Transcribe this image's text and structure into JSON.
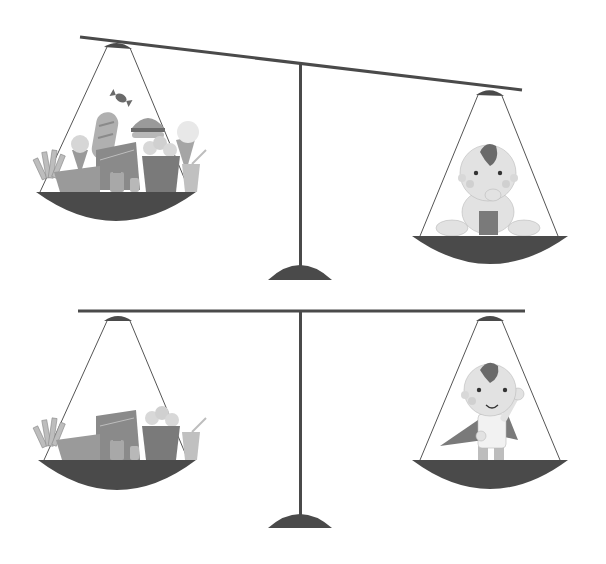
{
  "illustration": {
    "description": "Two balance scales comparing a pile of junk food with a baby/child",
    "colors": {
      "background": "#ffffff",
      "scale_dark": "#4a4a4a",
      "string": "#555555",
      "skin": "#e2e2e2",
      "skin_shade": "#d0d0d0",
      "hair": "#6a6a6a",
      "food_light": "#bdbdbd",
      "food_mid": "#9a9a9a",
      "food_dark": "#7a7a7a"
    },
    "scales": [
      {
        "id": "top",
        "state": "tilted",
        "left_pan": "junk-food",
        "right_pan": "sitting-baby",
        "heavier_side": "left"
      },
      {
        "id": "bottom",
        "state": "balanced",
        "left_pan": "junk-food",
        "right_pan": "waving-child-with-cape"
      }
    ]
  }
}
